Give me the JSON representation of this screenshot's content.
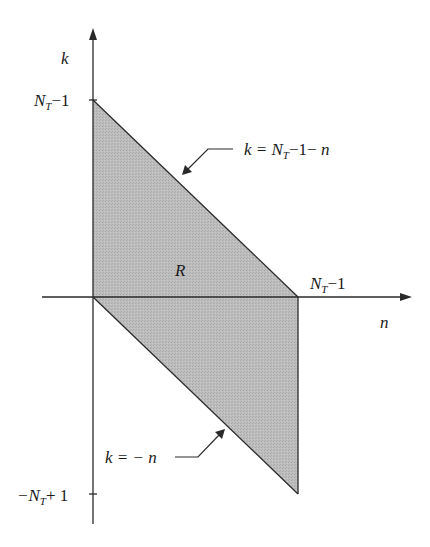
{
  "diagram": {
    "type": "region-plot",
    "axes": {
      "vertical_label": "k",
      "horizontal_label": "n"
    },
    "region_label": "R",
    "ticks": {
      "k_top": {
        "main": "N",
        "sub": "T",
        "rest": "−1"
      },
      "k_bottom": {
        "pre": "−N",
        "sub": "T",
        "rest": "+ 1"
      },
      "n_right": {
        "main": "N",
        "sub": "T",
        "rest": "−1"
      }
    },
    "annotations": {
      "upper_line": {
        "pre": "k",
        "eq": " = N",
        "sub": "T",
        "rest": "−1− ",
        "var": "n"
      },
      "lower_line": {
        "text": "k = − n"
      }
    },
    "colors": {
      "fill": "#b8b8b8",
      "stroke": "#2a2a2a"
    },
    "vertices": [
      [
        0,
        "N_T-1"
      ],
      [
        "N_T-1",
        0
      ],
      [
        "N_T-1",
        "-N_T+1"
      ],
      [
        0,
        0
      ]
    ]
  }
}
